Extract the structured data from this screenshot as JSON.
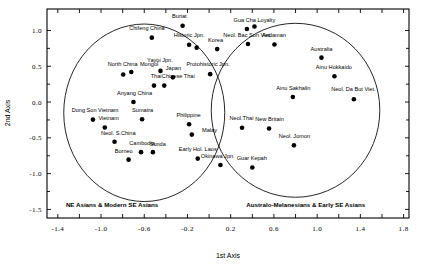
{
  "chart_data": {
    "type": "scatter",
    "title": "",
    "xlabel": "1st Axis",
    "ylabel": "2nd Axis",
    "xlim": [
      -1.5,
      1.85
    ],
    "ylim": [
      -1.62,
      1.3
    ],
    "xticks": [
      -1.4,
      -1.0,
      -0.6,
      -0.2,
      0.2,
      0.6,
      1.0,
      1.4,
      1.8
    ],
    "xticklabels": [
      "-1.4",
      "-1.0",
      "-0.6",
      "-0.2",
      "0.2",
      "0.6",
      "1.0",
      "1.4",
      "1.8"
    ],
    "yticks": [
      1.0,
      0.5,
      0.0,
      -0.5,
      -1.0,
      -1.5
    ],
    "yticklabels": [
      "1.0",
      "0.5",
      "0.0",
      "-0.5",
      "-1.0",
      "-1.5"
    ],
    "grid": false,
    "legend": "none",
    "points": [
      {
        "label": "Buriat",
        "x": -0.245,
        "y": 1.065,
        "lx": -0.275,
        "ly": 1.175,
        "anchor": "middle"
      },
      {
        "label": "Chifeng China",
        "x": -0.53,
        "y": 0.9,
        "lx": -0.575,
        "ly": 1.0,
        "anchor": "middle"
      },
      {
        "label": "Historic Jpn.",
        "x": -0.185,
        "y": 0.8,
        "lx": -0.185,
        "ly": 0.905,
        "anchor": "middle"
      },
      {
        "label": "",
        "x": -0.115,
        "y": 0.76,
        "lx": 0,
        "ly": 0,
        "anchor": "middle"
      },
      {
        "label": "Korea",
        "x": 0.075,
        "y": 0.74,
        "lx": 0.06,
        "ly": 0.845,
        "anchor": "middle"
      },
      {
        "label": "North China",
        "x": -0.795,
        "y": 0.385,
        "lx": -0.8,
        "ly": 0.51,
        "anchor": "middle"
      },
      {
        "label": "Mongol",
        "x": -0.72,
        "y": 0.42,
        "lx": -0.555,
        "ly": 0.51,
        "anchor": "middle"
      },
      {
        "label": "Yayoi Jpn.",
        "x": -0.45,
        "y": 0.435,
        "lx": -0.455,
        "ly": 0.56,
        "anchor": "middle"
      },
      {
        "label": "Japan",
        "x": -0.335,
        "y": 0.345,
        "lx": -0.33,
        "ly": 0.45,
        "anchor": "middle"
      },
      {
        "label": "Protohistoric Jpn.",
        "x": 0.01,
        "y": 0.39,
        "lx": -0.01,
        "ly": 0.5,
        "anchor": "middle"
      },
      {
        "label": "Thai",
        "x": -0.51,
        "y": 0.23,
        "lx": -0.49,
        "ly": 0.33,
        "anchor": "middle"
      },
      {
        "label": "Chinese Thai",
        "x": -0.415,
        "y": 0.23,
        "lx": -0.285,
        "ly": 0.33,
        "anchor": "middle"
      },
      {
        "label": "Anyang China",
        "x": -0.7,
        "y": 0.0,
        "lx": -0.69,
        "ly": 0.1,
        "anchor": "middle"
      },
      {
        "label": "Dong Son Vietnam",
        "x": -1.075,
        "y": -0.245,
        "lx": -1.055,
        "ly": -0.145,
        "anchor": "middle"
      },
      {
        "label": "Sumatra",
        "x": -0.62,
        "y": -0.24,
        "lx": -0.615,
        "ly": -0.135,
        "anchor": "middle"
      },
      {
        "label": "Vietnam",
        "x": -0.965,
        "y": -0.355,
        "lx": -0.93,
        "ly": -0.255,
        "anchor": "middle"
      },
      {
        "label": "Philippine",
        "x": -0.185,
        "y": -0.31,
        "lx": -0.19,
        "ly": -0.21,
        "anchor": "middle"
      },
      {
        "label": "Malay",
        "x": -0.16,
        "y": -0.455,
        "lx": -0.065,
        "ly": -0.425,
        "anchor": "start"
      },
      {
        "label": "Neol. S.China",
        "x": -0.875,
        "y": -0.555,
        "lx": -0.84,
        "ly": -0.455,
        "anchor": "middle"
      },
      {
        "label": "Cambodia",
        "x": -0.63,
        "y": -0.7,
        "lx": -0.62,
        "ly": -0.6,
        "anchor": "middle"
      },
      {
        "label": "Sunda",
        "x": -0.52,
        "y": -0.7,
        "lx": -0.475,
        "ly": -0.62,
        "anchor": "middle"
      },
      {
        "label": "Borneo",
        "x": -0.745,
        "y": -0.805,
        "lx": -0.79,
        "ly": -0.705,
        "anchor": "middle"
      },
      {
        "label": "Early Hol. Laos",
        "x": -0.105,
        "y": -0.79,
        "lx": -0.105,
        "ly": -0.69,
        "anchor": "middle"
      },
      {
        "label": "Gua Cha",
        "x": 0.35,
        "y": 1.02,
        "lx": 0.33,
        "ly": 1.12,
        "anchor": "middle"
      },
      {
        "label": "Loyalty",
        "x": 0.42,
        "y": 1.055,
        "lx": 0.53,
        "ly": 1.12,
        "anchor": "middle"
      },
      {
        "label": "Neol. Bac Son Viet.",
        "x": 0.36,
        "y": 0.81,
        "lx": 0.355,
        "ly": 0.91,
        "anchor": "middle"
      },
      {
        "label": "Andaman",
        "x": 0.605,
        "y": 0.805,
        "lx": 0.6,
        "ly": 0.905,
        "anchor": "middle"
      },
      {
        "label": "Australia",
        "x": 1.04,
        "y": 0.62,
        "lx": 1.04,
        "ly": 0.72,
        "anchor": "middle"
      },
      {
        "label": "Ainu Hokkaido",
        "x": 1.16,
        "y": 0.36,
        "lx": 1.155,
        "ly": 0.46,
        "anchor": "middle"
      },
      {
        "label": "Ainu Sakhalin",
        "x": 0.775,
        "y": 0.07,
        "lx": 0.78,
        "ly": 0.175,
        "anchor": "middle"
      },
      {
        "label": "Neol. Da But Viet.",
        "x": 1.34,
        "y": 0.04,
        "lx": 1.335,
        "ly": 0.15,
        "anchor": "middle"
      },
      {
        "label": "Neol.Thai",
        "x": 0.305,
        "y": -0.36,
        "lx": 0.3,
        "ly": -0.255,
        "anchor": "middle"
      },
      {
        "label": "New Britain",
        "x": 0.555,
        "y": -0.37,
        "lx": 0.56,
        "ly": -0.265,
        "anchor": "middle"
      },
      {
        "label": "Neol. Jomon",
        "x": 0.785,
        "y": -0.605,
        "lx": 0.79,
        "ly": -0.505,
        "anchor": "middle"
      },
      {
        "label": "Okinawa Jpn.",
        "x": 0.105,
        "y": -0.88,
        "lx": 0.08,
        "ly": -0.78,
        "anchor": "middle"
      },
      {
        "label": "Guar Kepah",
        "x": 0.4,
        "y": -0.915,
        "lx": 0.395,
        "ly": -0.815,
        "anchor": "middle"
      }
    ],
    "clusters": [
      {
        "name": "NE Asians & Modern SE Asians",
        "cx": -0.6,
        "cy": -0.15,
        "rx": 0.745,
        "ry": 1.24,
        "label_x": -1.325,
        "label_y": -1.465,
        "anchor": "start"
      },
      {
        "name": "Australo-Melanesians & Early SE Asians",
        "cx": 0.8,
        "cy": -0.115,
        "rx": 0.78,
        "ry": 1.215,
        "label_x": 0.345,
        "label_y": -1.465,
        "anchor": "start"
      }
    ]
  }
}
